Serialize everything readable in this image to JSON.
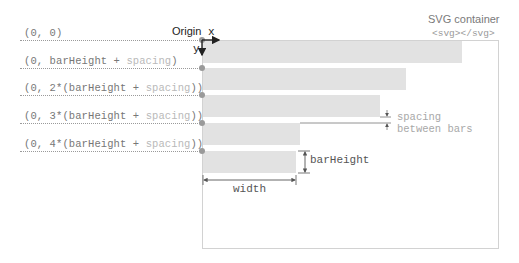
{
  "diagram": {
    "container": {
      "title": "SVG container",
      "tag": "<svg></svg>"
    },
    "origin_label": "Origin",
    "axes": {
      "x": "x",
      "y": "y"
    },
    "rows": [
      {
        "prefix": "(0, ",
        "main": "0",
        "spacing": "",
        "suffix": ")",
        "bar_width": 259
      },
      {
        "prefix": "(0, barHeight + ",
        "main": "",
        "spacing": "spacing",
        "suffix": ")",
        "bar_width": 203
      },
      {
        "prefix": "(0, 2*(barHeight + ",
        "main": "",
        "spacing": "spacing",
        "suffix": "))",
        "bar_width": 177
      },
      {
        "prefix": "(0, 3*(barHeight + ",
        "main": "",
        "spacing": "spacing",
        "suffix": "))",
        "bar_width": 97
      },
      {
        "prefix": "(0, 4*(barHeight + ",
        "main": "",
        "spacing": "spacing",
        "suffix": "))",
        "bar_width": 93
      }
    ],
    "annotations": {
      "spacing_line1": "spacing",
      "spacing_line2": "between bars",
      "bar_height": "barHeight",
      "width": "width"
    },
    "colors": {
      "bar": "#e2e2e2",
      "guide": "#9a9a9a",
      "spacing_text": "#b9b9b9",
      "axis": "#222222"
    }
  }
}
